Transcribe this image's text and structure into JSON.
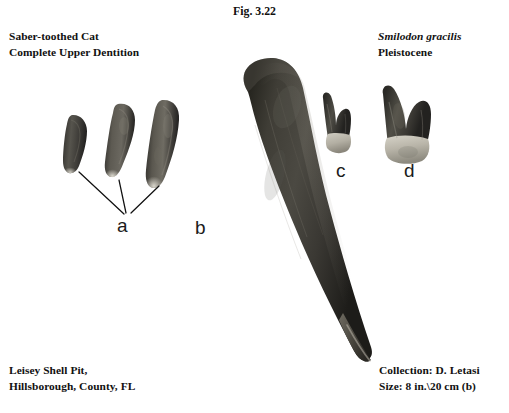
{
  "figure": {
    "caption": "Fig. 3.22",
    "background_color": "#ffffff",
    "text_color": "#111111"
  },
  "header_left": {
    "line1": "Saber-toothed Cat",
    "line2": "Complete Upper Dentition"
  },
  "header_right": {
    "taxon": "Smilodon gracilis",
    "epoch": "Pleistocene"
  },
  "footer_left": {
    "line1": "Leisey Shell Pit,",
    "line2": "Hillsborough, County, FL"
  },
  "footer_right": {
    "collection": "Collection: D. Letasi",
    "size": "Size: 8 in.\\20 cm (b)"
  },
  "specimen_labels": {
    "a": "a",
    "b": "b",
    "c": "c",
    "d": "d"
  },
  "specimens": [
    {
      "id": "incisor-1",
      "label_ref": "a",
      "description": "small upper incisor, leftmost",
      "fill": "#4a4843"
    },
    {
      "id": "incisor-2",
      "label_ref": "a",
      "description": "medium upper incisor, curved",
      "fill": "#55534d"
    },
    {
      "id": "incisor-3",
      "label_ref": "a",
      "description": "large upper incisor, rightmost",
      "fill": "#514f49"
    },
    {
      "id": "canine",
      "label_ref": "b",
      "description": "large curved saber canine tooth",
      "fill": "#3b3936"
    },
    {
      "id": "premolar-small",
      "label_ref": "c",
      "description": "small two-cusped premolar",
      "fill": "#4f4d47"
    },
    {
      "id": "premolar-large",
      "label_ref": "d",
      "description": "larger two-cusped premolar",
      "fill": "#4b4944"
    }
  ]
}
